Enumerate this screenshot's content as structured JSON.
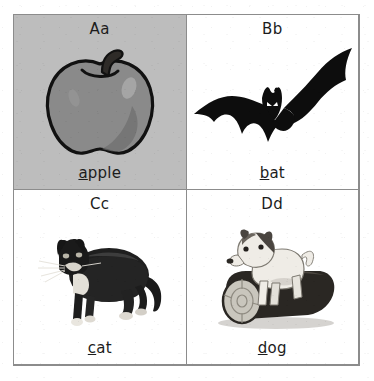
{
  "sheet": {
    "title": "Alphabet flashcard sheet",
    "columns": 2,
    "rows": 2,
    "border_color": "#8c8c8c",
    "page_background": "#ffffff"
  },
  "cards": [
    {
      "id": "card-a",
      "letter": "Aa",
      "word": "apple",
      "word_initial": "a",
      "word_rest": "pple",
      "picture": "apple-illustration",
      "background": "#bdbdbd",
      "tinted": true
    },
    {
      "id": "card-b",
      "letter": "Bb",
      "word": "bat",
      "word_initial": "b",
      "word_rest": "at",
      "picture": "bat-silhouette",
      "background": "#ffffff",
      "tinted": false
    },
    {
      "id": "card-c",
      "letter": "Cc",
      "word": "cat",
      "word_initial": "c",
      "word_rest": "at",
      "picture": "cat-photo",
      "background": "#ffffff",
      "tinted": false
    },
    {
      "id": "card-d",
      "letter": "Dd",
      "word": "dog",
      "word_initial": "d",
      "word_rest": "og",
      "picture": "dog-on-log-photo",
      "background": "#ffffff",
      "tinted": false
    }
  ],
  "colors": {
    "ink": "#1c1c1c",
    "rule": "#8c8c8c",
    "apple_body": "#8a8a8a",
    "apple_outline": "#111111",
    "bat_black": "#0d0d0d",
    "cat_black": "#1a1a1a",
    "cat_white": "#e8e6e2",
    "log_dark": "#2a2723",
    "log_face": "#c9c6bd",
    "dog_white": "#efece6",
    "dog_dark": "#4a4540"
  }
}
